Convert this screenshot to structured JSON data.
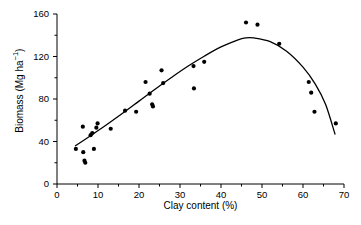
{
  "chart_data": {
    "type": "scatter",
    "title": "",
    "xlabel": "Clay content (%)",
    "ylabel": "Biomass (Mg ha⁻¹)",
    "ylabel_base": "Biomass (Mg ha",
    "ylabel_sup": "−1",
    "ylabel_tail": ")",
    "xlim": [
      0,
      70
    ],
    "ylim": [
      0,
      160
    ],
    "xticks": [
      0,
      10,
      20,
      30,
      40,
      50,
      60,
      70
    ],
    "yticks": [
      0,
      40,
      80,
      120,
      160
    ],
    "xminor_step": 5,
    "yminor_step": 20,
    "grid": false,
    "legend": "none",
    "marker": "filled-circle",
    "marker_color": "#000000",
    "fit_line_color": "#000000",
    "points": [
      {
        "x": 4.6,
        "y": 33
      },
      {
        "x": 6.3,
        "y": 54
      },
      {
        "x": 6.4,
        "y": 30
      },
      {
        "x": 6.7,
        "y": 22
      },
      {
        "x": 6.9,
        "y": 20
      },
      {
        "x": 8.2,
        "y": 46
      },
      {
        "x": 8.6,
        "y": 48
      },
      {
        "x": 9.0,
        "y": 33
      },
      {
        "x": 9.6,
        "y": 53
      },
      {
        "x": 9.9,
        "y": 57
      },
      {
        "x": 13.1,
        "y": 52
      },
      {
        "x": 16.6,
        "y": 69
      },
      {
        "x": 19.3,
        "y": 68
      },
      {
        "x": 21.6,
        "y": 96
      },
      {
        "x": 22.6,
        "y": 85
      },
      {
        "x": 23.2,
        "y": 75
      },
      {
        "x": 23.4,
        "y": 73
      },
      {
        "x": 25.5,
        "y": 107
      },
      {
        "x": 25.9,
        "y": 95
      },
      {
        "x": 33.3,
        "y": 111
      },
      {
        "x": 33.4,
        "y": 90
      },
      {
        "x": 35.9,
        "y": 115
      },
      {
        "x": 46.1,
        "y": 152
      },
      {
        "x": 48.9,
        "y": 150
      },
      {
        "x": 54.2,
        "y": 132
      },
      {
        "x": 61.4,
        "y": 96
      },
      {
        "x": 62.0,
        "y": 86
      },
      {
        "x": 62.8,
        "y": 68
      },
      {
        "x": 68.0,
        "y": 57
      }
    ],
    "fit_curve": {
      "description": "fitted quadratic trend line",
      "x_start": 4.5,
      "x_end": 67.8,
      "peak_x": 46,
      "peak_y": 138,
      "y_start": 36,
      "y_end": 47,
      "points": [
        {
          "x": 4.5,
          "y": 36.0
        },
        {
          "x": 8.0,
          "y": 45.0
        },
        {
          "x": 12.0,
          "y": 55.5
        },
        {
          "x": 16.0,
          "y": 66.5
        },
        {
          "x": 20.0,
          "y": 78.0
        },
        {
          "x": 24.0,
          "y": 89.5
        },
        {
          "x": 28.0,
          "y": 100.5
        },
        {
          "x": 32.0,
          "y": 111.0
        },
        {
          "x": 36.0,
          "y": 120.5
        },
        {
          "x": 40.0,
          "y": 129.0
        },
        {
          "x": 44.0,
          "y": 135.5
        },
        {
          "x": 46.0,
          "y": 137.5
        },
        {
          "x": 48.0,
          "y": 137.5
        },
        {
          "x": 52.0,
          "y": 134.0
        },
        {
          "x": 56.0,
          "y": 125.0
        },
        {
          "x": 60.0,
          "y": 110.0
        },
        {
          "x": 63.0,
          "y": 94.0
        },
        {
          "x": 65.5,
          "y": 75.0
        },
        {
          "x": 67.8,
          "y": 47.0
        }
      ]
    }
  }
}
